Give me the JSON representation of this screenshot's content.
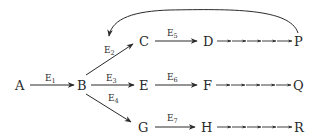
{
  "diagram": {
    "type": "directed-graph",
    "nodes": {
      "A": "A",
      "B": "B",
      "C": "C",
      "D": "D",
      "E": "E",
      "F": "F",
      "G": "G",
      "H": "H",
      "P": "P",
      "Q": "Q",
      "R": "R"
    },
    "edges": [
      {
        "from": "A",
        "to": "B",
        "label": "E",
        "sub": "1"
      },
      {
        "from": "B",
        "to": "C",
        "label": "E",
        "sub": "2"
      },
      {
        "from": "B",
        "to": "E",
        "label": "E",
        "sub": "3"
      },
      {
        "from": "B",
        "to": "G",
        "label": "E",
        "sub": "4"
      },
      {
        "from": "C",
        "to": "D",
        "label": "E",
        "sub": "5"
      },
      {
        "from": "E",
        "to": "F",
        "label": "E",
        "sub": "6"
      },
      {
        "from": "G",
        "to": "H",
        "label": "E",
        "sub": "7"
      }
    ],
    "chains": [
      {
        "from": "D",
        "to": "P",
        "steps": 5
      },
      {
        "from": "F",
        "to": "Q",
        "steps": 5
      },
      {
        "from": "H",
        "to": "R",
        "steps": 5
      }
    ],
    "feedback": {
      "from": "P",
      "to": "B-C edge (E2)",
      "style": "curved-arrow"
    },
    "line_color": "#2a2a2a",
    "background": "#ffffff"
  }
}
